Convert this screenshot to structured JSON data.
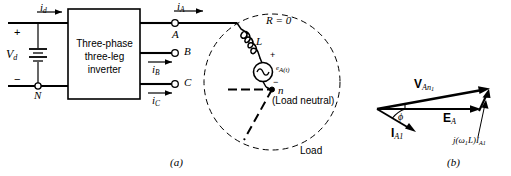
{
  "figure": {
    "caption_a": "(a)",
    "caption_b": "(b)"
  },
  "circuit": {
    "dc_source": {
      "voltage_label": "V",
      "voltage_sub": "d",
      "plus_sign": "+",
      "minus_sign": "−",
      "neutral_node": "N",
      "dc_current_label": "i",
      "dc_current_sub": "d"
    },
    "inverter_block": {
      "line1": "Three-phase",
      "line2": "three-leg",
      "line3": "inverter"
    },
    "terminals": [
      {
        "name": "A",
        "current_label": "i",
        "current_sub": "A"
      },
      {
        "name": "B",
        "current_label": "i",
        "current_sub": "B"
      },
      {
        "name": "C",
        "current_label": "i",
        "current_sub": "C"
      }
    ],
    "load": {
      "boundary_label": "Load",
      "resistance_label": "R = 0",
      "inductor_label": "L",
      "source_label_main": "e",
      "source_label_sub": "A(t)",
      "source_plus": "+",
      "source_minus": "−",
      "neutral_node": "n",
      "neutral_note": "(Load neutral)"
    }
  },
  "phasor": {
    "voltage_phasor": {
      "symbol": "V",
      "subscript": "An",
      "subscript2": "1"
    },
    "emf_phasor": {
      "symbol": "E",
      "subscript": "A"
    },
    "current_phasor": {
      "symbol": "I",
      "subscript": "A1"
    },
    "reactance_drop": {
      "text": "j(ω",
      "sub1": "1",
      "mid": "L)I",
      "sub2": "A1"
    },
    "angle_label": "ϕ"
  },
  "colors": {
    "ink": "#000000",
    "background": "#ffffff"
  }
}
